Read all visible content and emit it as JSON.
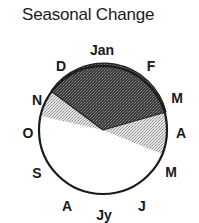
{
  "title": "Seasonal Change",
  "months": [
    {
      "label": "Jan",
      "x": 102,
      "y": 55
    },
    {
      "label": "F",
      "x": 151,
      "y": 71
    },
    {
      "label": "M",
      "x": 177,
      "y": 103
    },
    {
      "label": "A",
      "x": 181,
      "y": 138
    },
    {
      "label": "M",
      "x": 171,
      "y": 177
    },
    {
      "label": "J",
      "x": 142,
      "y": 211
    },
    {
      "label": "Jy",
      "x": 104,
      "y": 220
    },
    {
      "label": "A",
      "x": 67,
      "y": 211
    },
    {
      "label": "S",
      "x": 37,
      "y": 178
    },
    {
      "label": "O",
      "x": 28,
      "y": 138
    },
    {
      "label": "N",
      "x": 37,
      "y": 105
    },
    {
      "label": "D",
      "x": 61,
      "y": 71
    }
  ],
  "dial": {
    "center": [
      103,
      130
    ],
    "radius": 64,
    "segments": [
      {
        "name": "dark-sector",
        "from_month": "D (late Nov)",
        "to_month": "M (Mar)",
        "fill": "#4a4a4a"
      },
      {
        "name": "light-sector-left",
        "from_month": "O/N",
        "to_month": "N",
        "fill": "#c8c8c8"
      },
      {
        "name": "light-sector-right",
        "from_month": "M (Mar)",
        "to_month": "A/M (Apr)",
        "fill": "#c8c8c8"
      },
      {
        "name": "white-sector",
        "from_month": "A (Apr)",
        "to_month": "O (Oct)",
        "fill": "#ffffff"
      }
    ]
  },
  "colors": {
    "outline": "#1a1a1a",
    "dark": "#4a4a4a",
    "light": "#c8c8c8",
    "background": "#ffffff"
  }
}
